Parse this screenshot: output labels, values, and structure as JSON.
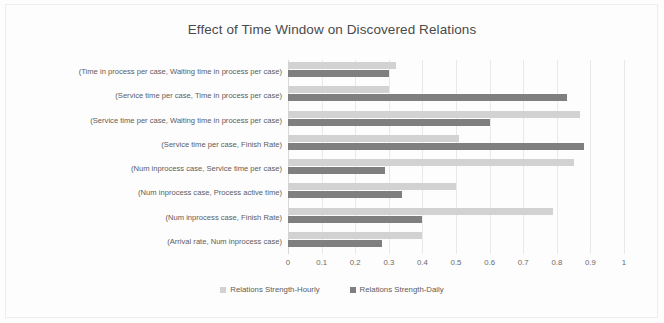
{
  "chart_data": {
    "type": "bar",
    "orientation": "horizontal",
    "title": "Effect of Time Window on Discovered Relations",
    "xlabel": "",
    "ylabel": "",
    "xlim": [
      0,
      1
    ],
    "xticks": [
      "0",
      "0.1",
      "0.2",
      "0.3",
      "0.4",
      "0.5",
      "0.6",
      "0.7",
      "0.8",
      "0.9",
      "1"
    ],
    "xtick_values": [
      0,
      0.1,
      0.2,
      0.3,
      0.4,
      0.5,
      0.6,
      0.7,
      0.8,
      0.9,
      1
    ],
    "grid": true,
    "legend_position": "bottom",
    "categories": [
      "(Time in process per case, Waiting time in process per case)",
      "(Service time per case, Time in process per case)",
      "(Service time per case, Waiting time in process per case)",
      "(Service time per case, Finish Rate)",
      "(Num inprocess case, Service time per case)",
      "(Num inprocess case, Process active time)",
      "(Num inprocess case, Finish Rate)",
      "(Arrival rate, Num inprocess case)"
    ],
    "series": [
      {
        "name": "Relations Strength-Hourly",
        "color": "#d2d2d2",
        "values": [
          0.32,
          0.3,
          0.87,
          0.51,
          0.85,
          0.5,
          0.79,
          0.4
        ]
      },
      {
        "name": "Relations Strength-Daily",
        "color": "#7f7f7f",
        "values": [
          0.3,
          0.83,
          0.6,
          0.88,
          0.29,
          0.34,
          0.4,
          0.28
        ]
      }
    ]
  }
}
